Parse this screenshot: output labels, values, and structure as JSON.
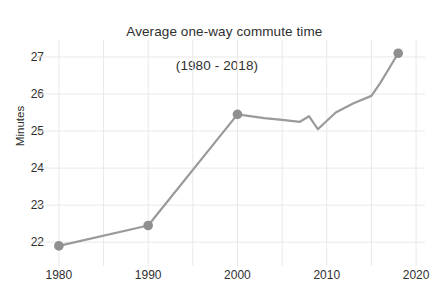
{
  "chart_data": {
    "type": "line",
    "title": "Average one-way commute time",
    "subtitle": "(1980 - 2018)",
    "xlabel": "",
    "ylabel": "Minutes",
    "xlim": [
      1978,
      2021
    ],
    "ylim": [
      21.6,
      27.35
    ],
    "xticks": [
      1980,
      1990,
      2000,
      2010,
      2020
    ],
    "xtick_labels": [
      "1980",
      "1990",
      "2000",
      "2010",
      "2020"
    ],
    "yticks": [
      22,
      23,
      24,
      25,
      26,
      27
    ],
    "ytick_labels": [
      "22",
      "23",
      "24",
      "25",
      "26",
      "27"
    ],
    "grid": true,
    "grid_color": "#e9e9e9",
    "legend": "none",
    "line_color": "#9a9a9a",
    "marker_color": "#8f8f8f",
    "marker_years": [
      1980,
      1990,
      2000,
      2018
    ],
    "x": [
      1980,
      1990,
      2000,
      2003,
      2005,
      2007,
      2008,
      2009,
      2011,
      2013,
      2015,
      2016,
      2018
    ],
    "y": [
      21.9,
      22.45,
      25.45,
      25.35,
      25.3,
      25.25,
      25.4,
      25.05,
      25.5,
      25.75,
      25.95,
      26.3,
      27.1
    ],
    "series": [
      {
        "name": "Average one-way commute time",
        "points": [
          {
            "x": 1980,
            "y": 21.9
          },
          {
            "x": 1990,
            "y": 22.45
          },
          {
            "x": 2000,
            "y": 25.45
          },
          {
            "x": 2003,
            "y": 25.35
          },
          {
            "x": 2005,
            "y": 25.3
          },
          {
            "x": 2007,
            "y": 25.25
          },
          {
            "x": 2008,
            "y": 25.4
          },
          {
            "x": 2009,
            "y": 25.05
          },
          {
            "x": 2011,
            "y": 25.5
          },
          {
            "x": 2013,
            "y": 25.75
          },
          {
            "x": 2015,
            "y": 25.95
          },
          {
            "x": 2016,
            "y": 26.3
          },
          {
            "x": 2018,
            "y": 27.1
          }
        ]
      }
    ]
  }
}
